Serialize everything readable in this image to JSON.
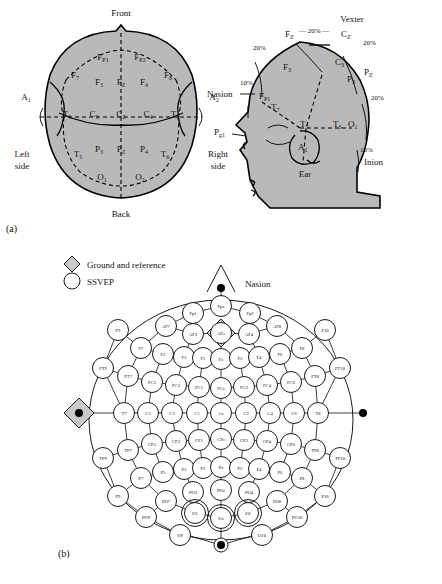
{
  "figure": {
    "panel_a_label": "(a)",
    "panel_b_label": "(b)"
  },
  "panel_a": {
    "top_view": {
      "caption_front": "Front",
      "caption_back": "Back",
      "caption_left": "Left side",
      "caption_right": "Right side",
      "ear_left": "A1",
      "ear_right": "A2",
      "electrodes": [
        {
          "id": "Fp1",
          "base": "F",
          "sub": "P1",
          "x": 103,
          "y": 60
        },
        {
          "id": "Fp2",
          "base": "F",
          "sub": "P2",
          "x": 140,
          "y": 60
        },
        {
          "id": "F7",
          "base": "F",
          "sub": "7",
          "x": 75,
          "y": 78
        },
        {
          "id": "F3",
          "base": "F",
          "sub": "3",
          "x": 99,
          "y": 85
        },
        {
          "id": "Fz",
          "base": "F",
          "sub": "Z",
          "x": 121,
          "y": 85
        },
        {
          "id": "F4",
          "base": "F",
          "sub": "4",
          "x": 144,
          "y": 85
        },
        {
          "id": "F8",
          "base": "F",
          "sub": "8",
          "x": 168,
          "y": 78
        },
        {
          "id": "T3",
          "base": "T",
          "sub": "3",
          "x": 67,
          "y": 117
        },
        {
          "id": "C3",
          "base": "C",
          "sub": "3",
          "x": 94,
          "y": 117
        },
        {
          "id": "Cz",
          "base": "C",
          "sub": "Z",
          "x": 121,
          "y": 117
        },
        {
          "id": "C4",
          "base": "C",
          "sub": "4",
          "x": 148,
          "y": 117
        },
        {
          "id": "T4",
          "base": "T",
          "sub": "4",
          "x": 175,
          "y": 117
        },
        {
          "id": "T5",
          "base": "T",
          "sub": "5",
          "x": 78,
          "y": 157
        },
        {
          "id": "P3",
          "base": "P",
          "sub": "3",
          "x": 99,
          "y": 152
        },
        {
          "id": "Pz",
          "base": "P",
          "sub": "Z",
          "x": 121,
          "y": 152
        },
        {
          "id": "P4",
          "base": "P",
          "sub": "4",
          "x": 144,
          "y": 152
        },
        {
          "id": "T6",
          "base": "T",
          "sub": "6",
          "x": 165,
          "y": 157
        },
        {
          "id": "O1",
          "base": "O",
          "sub": "1",
          "x": 102,
          "y": 180
        },
        {
          "id": "O2",
          "base": "O",
          "sub": "2",
          "x": 140,
          "y": 180
        }
      ]
    },
    "side_view": {
      "vertex": "Vexter",
      "nasion": "Nasion",
      "inion": "Inion",
      "ear": "Ear",
      "pg1_base": "P",
      "pg1_sub": "g1",
      "a1": "A1",
      "percents": [
        "20%",
        "20%",
        "20%",
        "20%",
        "10%",
        "10%"
      ],
      "electrodes": [
        {
          "id": "Fz",
          "base": "F",
          "sub": "Z"
        },
        {
          "id": "Cz",
          "base": "C",
          "sub": "Z"
        },
        {
          "id": "Pz",
          "base": "P",
          "sub": "Z"
        },
        {
          "id": "F3",
          "base": "F",
          "sub": "3"
        },
        {
          "id": "C3",
          "base": "C",
          "sub": "3"
        },
        {
          "id": "P3",
          "base": "P",
          "sub": "3"
        },
        {
          "id": "Fp1",
          "base": "F",
          "sub": "P1"
        },
        {
          "id": "T7",
          "base": "T",
          "sub": "7"
        },
        {
          "id": "T3",
          "base": "T",
          "sub": "3"
        },
        {
          "id": "T5",
          "base": "T",
          "sub": "S"
        },
        {
          "id": "O1",
          "base": "O",
          "sub": "1"
        }
      ]
    }
  },
  "panel_b": {
    "legend": [
      {
        "marker": "diamond",
        "label": "Ground and reference"
      },
      {
        "marker": "circle",
        "label": "SSVEP"
      }
    ],
    "nasion_label": "Nasion",
    "ground_electrode": "AFz",
    "ssvep_electrodes": [
      "O1",
      "Oz",
      "O2"
    ],
    "electrodes": [
      {
        "id": "Fp1",
        "x": 193,
        "y": 313
      },
      {
        "id": "Fpz",
        "x": 221,
        "y": 306
      },
      {
        "id": "Fp2",
        "x": 250,
        "y": 313
      },
      {
        "id": "AF7",
        "x": 166,
        "y": 326
      },
      {
        "id": "AF3",
        "x": 193,
        "y": 334
      },
      {
        "id": "AFz",
        "x": 221,
        "y": 333
      },
      {
        "id": "AF4",
        "x": 249,
        "y": 334
      },
      {
        "id": "AF8",
        "x": 277,
        "y": 326
      },
      {
        "id": "F9",
        "x": 118,
        "y": 330
      },
      {
        "id": "F7",
        "x": 141,
        "y": 348
      },
      {
        "id": "F5",
        "x": 163,
        "y": 354
      },
      {
        "id": "F3",
        "x": 184,
        "y": 357
      },
      {
        "id": "F1",
        "x": 203,
        "y": 358
      },
      {
        "id": "Fz",
        "x": 221,
        "y": 359
      },
      {
        "id": "F2",
        "x": 240,
        "y": 358
      },
      {
        "id": "F4",
        "x": 259,
        "y": 357
      },
      {
        "id": "F6",
        "x": 280,
        "y": 354
      },
      {
        "id": "F8",
        "x": 302,
        "y": 348
      },
      {
        "id": "F10",
        "x": 325,
        "y": 330
      },
      {
        "id": "FT9",
        "x": 103,
        "y": 368
      },
      {
        "id": "FT7",
        "x": 128,
        "y": 376
      },
      {
        "id": "FC5",
        "x": 152,
        "y": 382
      },
      {
        "id": "FC3",
        "x": 176,
        "y": 385
      },
      {
        "id": "FC1",
        "x": 199,
        "y": 387
      },
      {
        "id": "FCz",
        "x": 221,
        "y": 388
      },
      {
        "id": "FC2",
        "x": 244,
        "y": 387
      },
      {
        "id": "FC4",
        "x": 267,
        "y": 385
      },
      {
        "id": "FC6",
        "x": 291,
        "y": 382
      },
      {
        "id": "FT8",
        "x": 315,
        "y": 376
      },
      {
        "id": "FT10",
        "x": 340,
        "y": 368
      },
      {
        "id": "T7",
        "x": 124,
        "y": 413
      },
      {
        "id": "C5",
        "x": 148,
        "y": 413
      },
      {
        "id": "C3",
        "x": 172,
        "y": 413
      },
      {
        "id": "C1",
        "x": 197,
        "y": 413
      },
      {
        "id": "Cz",
        "x": 221,
        "y": 413
      },
      {
        "id": "C2",
        "x": 246,
        "y": 413
      },
      {
        "id": "C4",
        "x": 270,
        "y": 413
      },
      {
        "id": "C6",
        "x": 294,
        "y": 413
      },
      {
        "id": "T8",
        "x": 318,
        "y": 413
      },
      {
        "id": "TP9",
        "x": 103,
        "y": 458
      },
      {
        "id": "TP7",
        "x": 128,
        "y": 450
      },
      {
        "id": "CP5",
        "x": 152,
        "y": 444
      },
      {
        "id": "CP3",
        "x": 176,
        "y": 441
      },
      {
        "id": "CP1",
        "x": 199,
        "y": 440
      },
      {
        "id": "CPz",
        "x": 221,
        "y": 439
      },
      {
        "id": "CP2",
        "x": 244,
        "y": 440
      },
      {
        "id": "CP4",
        "x": 267,
        "y": 441
      },
      {
        "id": "CP6",
        "x": 291,
        "y": 444
      },
      {
        "id": "TP8",
        "x": 315,
        "y": 450
      },
      {
        "id": "TP10",
        "x": 340,
        "y": 458
      },
      {
        "id": "P9",
        "x": 118,
        "y": 496
      },
      {
        "id": "P7",
        "x": 141,
        "y": 478
      },
      {
        "id": "P5",
        "x": 163,
        "y": 472
      },
      {
        "id": "P3",
        "x": 184,
        "y": 469
      },
      {
        "id": "P1",
        "x": 203,
        "y": 468
      },
      {
        "id": "Pz",
        "x": 221,
        "y": 467
      },
      {
        "id": "P2",
        "x": 240,
        "y": 468
      },
      {
        "id": "P4",
        "x": 259,
        "y": 469
      },
      {
        "id": "P6",
        "x": 280,
        "y": 472
      },
      {
        "id": "P8",
        "x": 302,
        "y": 478
      },
      {
        "id": "P10",
        "x": 325,
        "y": 496
      },
      {
        "id": "PO9",
        "x": 146,
        "y": 517
      },
      {
        "id": "PO7",
        "x": 166,
        "y": 501
      },
      {
        "id": "PO3",
        "x": 193,
        "y": 492
      },
      {
        "id": "POz",
        "x": 221,
        "y": 490
      },
      {
        "id": "PO4",
        "x": 249,
        "y": 492
      },
      {
        "id": "PO8",
        "x": 277,
        "y": 501
      },
      {
        "id": "PO10",
        "x": 297,
        "y": 517
      },
      {
        "id": "O1",
        "x": 195,
        "y": 513
      },
      {
        "id": "Oz",
        "x": 221,
        "y": 518
      },
      {
        "id": "O2",
        "x": 248,
        "y": 513
      },
      {
        "id": "O9",
        "x": 180,
        "y": 535
      },
      {
        "id": "O10",
        "x": 262,
        "y": 535
      }
    ],
    "links": [
      [
        "Fp1",
        "Fpz"
      ],
      [
        "Fpz",
        "Fp2"
      ],
      [
        "Fp1",
        "AF7"
      ],
      [
        "Fp2",
        "AF8"
      ],
      [
        "AF7",
        "AF3"
      ],
      [
        "AF3",
        "AFz"
      ],
      [
        "AFz",
        "AF4"
      ],
      [
        "AF4",
        "AF8"
      ],
      [
        "AF7",
        "F7"
      ],
      [
        "AF8",
        "F8"
      ],
      [
        "AF3",
        "F3"
      ],
      [
        "AF4",
        "F4"
      ],
      [
        "AFz",
        "Fz"
      ],
      [
        "F9",
        "F7"
      ],
      [
        "F7",
        "F5"
      ],
      [
        "F5",
        "F3"
      ],
      [
        "F3",
        "F1"
      ],
      [
        "F1",
        "Fz"
      ],
      [
        "Fz",
        "F2"
      ],
      [
        "F2",
        "F4"
      ],
      [
        "F4",
        "F6"
      ],
      [
        "F6",
        "F8"
      ],
      [
        "F8",
        "F10"
      ],
      [
        "F9",
        "FT9"
      ],
      [
        "F10",
        "FT10"
      ],
      [
        "FT9",
        "FT7"
      ],
      [
        "FT7",
        "FC5"
      ],
      [
        "FC5",
        "FC3"
      ],
      [
        "FC3",
        "FC1"
      ],
      [
        "FC1",
        "FCz"
      ],
      [
        "FCz",
        "FC2"
      ],
      [
        "FC2",
        "FC4"
      ],
      [
        "FC4",
        "FC6"
      ],
      [
        "FC6",
        "FT8"
      ],
      [
        "FT8",
        "FT10"
      ],
      [
        "F7",
        "FT7"
      ],
      [
        "F5",
        "FC5"
      ],
      [
        "F3",
        "FC3"
      ],
      [
        "F1",
        "FC1"
      ],
      [
        "Fz",
        "FCz"
      ],
      [
        "F2",
        "FC2"
      ],
      [
        "F4",
        "FC4"
      ],
      [
        "F6",
        "FC6"
      ],
      [
        "F8",
        "FT8"
      ],
      [
        "FT9",
        "T7"
      ],
      [
        "FT10",
        "T8"
      ],
      [
        "T7",
        "C5"
      ],
      [
        "C5",
        "C3"
      ],
      [
        "C3",
        "C1"
      ],
      [
        "C1",
        "Cz"
      ],
      [
        "Cz",
        "C2"
      ],
      [
        "C2",
        "C4"
      ],
      [
        "C4",
        "C6"
      ],
      [
        "C6",
        "T8"
      ],
      [
        "FT7",
        "T7"
      ],
      [
        "FC5",
        "C5"
      ],
      [
        "FC3",
        "C3"
      ],
      [
        "FC1",
        "C1"
      ],
      [
        "FCz",
        "Cz"
      ],
      [
        "FC2",
        "C2"
      ],
      [
        "FC4",
        "C4"
      ],
      [
        "FC6",
        "C6"
      ],
      [
        "FT8",
        "T8"
      ],
      [
        "T7",
        "TP7"
      ],
      [
        "C5",
        "CP5"
      ],
      [
        "C3",
        "CP3"
      ],
      [
        "C1",
        "CP1"
      ],
      [
        "Cz",
        "CPz"
      ],
      [
        "C2",
        "CP2"
      ],
      [
        "C4",
        "CP4"
      ],
      [
        "C6",
        "CP6"
      ],
      [
        "T8",
        "TP8"
      ],
      [
        "TP9",
        "TP7"
      ],
      [
        "TP7",
        "CP5"
      ],
      [
        "CP5",
        "CP3"
      ],
      [
        "CP3",
        "CP1"
      ],
      [
        "CP1",
        "CPz"
      ],
      [
        "CPz",
        "CP2"
      ],
      [
        "CP2",
        "CP4"
      ],
      [
        "CP4",
        "CP6"
      ],
      [
        "CP6",
        "TP8"
      ],
      [
        "TP8",
        "TP10"
      ],
      [
        "TP9",
        "P9"
      ],
      [
        "TP10",
        "P10"
      ],
      [
        "TP7",
        "P7"
      ],
      [
        "CP5",
        "P5"
      ],
      [
        "CP3",
        "P3"
      ],
      [
        "CP1",
        "P1"
      ],
      [
        "CPz",
        "Pz"
      ],
      [
        "CP2",
        "P2"
      ],
      [
        "CP4",
        "P4"
      ],
      [
        "CP6",
        "P6"
      ],
      [
        "TP8",
        "P8"
      ],
      [
        "P9",
        "P7"
      ],
      [
        "P7",
        "P5"
      ],
      [
        "P5",
        "P3"
      ],
      [
        "P3",
        "P1"
      ],
      [
        "P1",
        "Pz"
      ],
      [
        "Pz",
        "P2"
      ],
      [
        "P2",
        "P4"
      ],
      [
        "P4",
        "P6"
      ],
      [
        "P6",
        "P8"
      ],
      [
        "P8",
        "P10"
      ],
      [
        "P7",
        "PO7"
      ],
      [
        "P3",
        "PO3"
      ],
      [
        "Pz",
        "POz"
      ],
      [
        "P4",
        "PO4"
      ],
      [
        "P8",
        "PO8"
      ],
      [
        "PO7",
        "O1"
      ],
      [
        "PO3",
        "O1"
      ],
      [
        "POz",
        "Oz"
      ],
      [
        "PO4",
        "O2"
      ],
      [
        "PO8",
        "O2"
      ],
      [
        "O1",
        "Oz"
      ],
      [
        "Oz",
        "O2"
      ],
      [
        "PO9",
        "O9"
      ],
      [
        "PO10",
        "O10"
      ],
      [
        "PO7",
        "PO9"
      ],
      [
        "PO8",
        "PO10"
      ],
      [
        "P9",
        "PO9"
      ],
      [
        "P10",
        "PO10"
      ]
    ]
  }
}
